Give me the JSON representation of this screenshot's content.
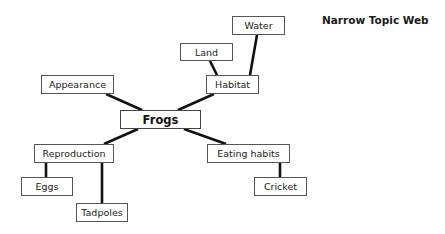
{
  "title": "Narrow Topic Web",
  "center": {
    "label": "Frogs"
  },
  "nodes": {
    "appearance": {
      "label": "Appearance"
    },
    "habitat": {
      "label": "Habitat"
    },
    "land": {
      "label": "Land"
    },
    "water": {
      "label": "Water"
    },
    "reproduction": {
      "label": "Reproduction"
    },
    "eggs": {
      "label": "Eggs"
    },
    "tadpoles": {
      "label": "Tadpoles"
    },
    "eating_habits": {
      "label": "Eating habits"
    },
    "cricket": {
      "label": "Cricket"
    }
  },
  "edges": [
    [
      "Frogs",
      "Appearance"
    ],
    [
      "Frogs",
      "Habitat"
    ],
    [
      "Frogs",
      "Reproduction"
    ],
    [
      "Frogs",
      "Eating habits"
    ],
    [
      "Habitat",
      "Land"
    ],
    [
      "Habitat",
      "Water"
    ],
    [
      "Reproduction",
      "Eggs"
    ],
    [
      "Reproduction",
      "Tadpoles"
    ],
    [
      "Eating habits",
      "Cricket"
    ]
  ],
  "colors": {
    "line": "#111111",
    "border": "#555555",
    "background": "#ffffff"
  }
}
